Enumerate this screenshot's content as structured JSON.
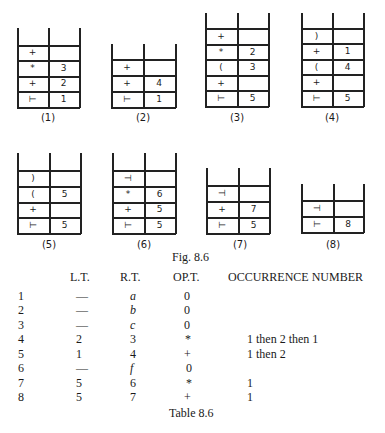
{
  "figure": {
    "caption": "Fig. 8.6",
    "stacks": [
      {
        "label": "(1)",
        "rows": [
          [
            "+",
            ""
          ],
          [
            "*",
            "3"
          ],
          [
            "+",
            "2"
          ],
          [
            "⊢",
            "1"
          ]
        ]
      },
      {
        "label": "(2)",
        "rows": [
          [
            "+",
            ""
          ],
          [
            "+",
            "4"
          ],
          [
            "⊢",
            "1"
          ]
        ]
      },
      {
        "label": "(3)",
        "rows": [
          [
            "+",
            ""
          ],
          [
            "*",
            "2"
          ],
          [
            "(",
            "3"
          ],
          [
            "+",
            ""
          ],
          [
            "⊢",
            "5"
          ]
        ]
      },
      {
        "label": "(4)",
        "rows": [
          [
            ")",
            ""
          ],
          [
            "+",
            "1"
          ],
          [
            "(",
            "4"
          ],
          [
            "+",
            ""
          ],
          [
            "⊢",
            "5"
          ]
        ]
      },
      {
        "label": "(5)",
        "rows": [
          [
            ")",
            ""
          ],
          [
            "(",
            "5"
          ],
          [
            "+",
            ""
          ],
          [
            "⊢",
            "5"
          ]
        ]
      },
      {
        "label": "(6)",
        "rows": [
          [
            "⊣",
            ""
          ],
          [
            "*",
            "6"
          ],
          [
            "+",
            "5"
          ],
          [
            "⊢",
            "5"
          ]
        ]
      },
      {
        "label": "(7)",
        "rows": [
          [
            "⊣",
            ""
          ],
          [
            "+",
            "7"
          ],
          [
            "⊢",
            "5"
          ]
        ]
      },
      {
        "label": "(8)",
        "rows": [
          [
            "⊣",
            ""
          ],
          [
            "⊢",
            "8"
          ]
        ]
      }
    ]
  },
  "table": {
    "caption": "Table 8.6",
    "headers": [
      "",
      "L.T.",
      "R.T.",
      "OP.T.",
      "OCCURRENCE NUMBER"
    ],
    "rows": [
      [
        "1",
        "—",
        "a",
        "0",
        ""
      ],
      [
        "2",
        "—",
        "b",
        "0",
        ""
      ],
      [
        "3",
        "—",
        "c",
        "0",
        ""
      ],
      [
        "4",
        "2",
        "3",
        "*",
        "1 then 2 then 1"
      ],
      [
        "5",
        "1",
        "4",
        "+",
        "1 then 2"
      ],
      [
        "6",
        "—",
        "f",
        "0",
        ""
      ],
      [
        "7",
        "5",
        "6",
        "*",
        "1"
      ],
      [
        "8",
        "5",
        "7",
        "+",
        "1"
      ]
    ]
  }
}
